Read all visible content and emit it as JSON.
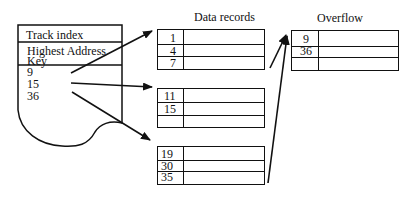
{
  "track_index": {
    "title": "Track index",
    "header_line1": "Highest  Address",
    "header_line2": "Key",
    "keys": [
      "9",
      "15",
      "36"
    ]
  },
  "data_records": {
    "title": "Data records",
    "blocks": [
      {
        "keys": [
          "1",
          "4",
          "7"
        ]
      },
      {
        "keys": [
          "11",
          "15",
          ""
        ]
      },
      {
        "keys": [
          "19",
          "30",
          "35"
        ]
      }
    ]
  },
  "overflow": {
    "title": "Overflow",
    "keys": [
      "9",
      "36",
      ""
    ]
  }
}
